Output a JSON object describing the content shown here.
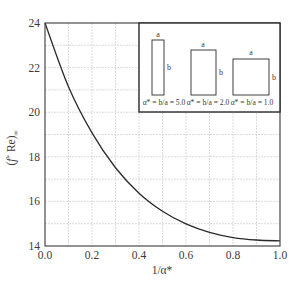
{
  "chart_data": {
    "type": "line",
    "title": "",
    "xlabel": "1/α*",
    "ylabel": "(f* Re)∞",
    "xlim": [
      0.0,
      1.0
    ],
    "ylim": [
      14,
      24
    ],
    "grid": true,
    "x_ticks": [
      "0.0",
      "0.2",
      "0.4",
      "0.6",
      "0.8",
      "1.0"
    ],
    "x_tick_values": [
      0.0,
      0.2,
      0.4,
      0.6,
      0.8,
      1.0
    ],
    "y_ticks": [
      "14",
      "16",
      "18",
      "20",
      "22",
      "24"
    ],
    "y_tick_values": [
      14,
      16,
      18,
      20,
      22,
      24
    ],
    "x_grid_step": 0.1,
    "y_grid_step": 1,
    "series": [
      {
        "name": "(f* Re)∞ vs 1/α*",
        "x": [
          0.0,
          0.1,
          0.2,
          0.3,
          0.4,
          0.5,
          0.6,
          0.7,
          0.8,
          0.9,
          1.0
        ],
        "values": [
          24.0,
          21.14,
          19.07,
          17.51,
          16.37,
          15.56,
          14.99,
          14.61,
          14.38,
          14.27,
          14.23
        ],
        "color": "#2a2a2a"
      }
    ],
    "legend": null,
    "inset": {
      "shapes": [
        {
          "label": "α* = b/a = 5.0",
          "side_a": "a",
          "side_b": "b"
        },
        {
          "label": "α* = b/a = 2.0",
          "side_a": "a",
          "side_b": "b"
        },
        {
          "label": "α* = b/a = 1.0",
          "side_a": "a",
          "side_b": "b"
        }
      ]
    }
  }
}
